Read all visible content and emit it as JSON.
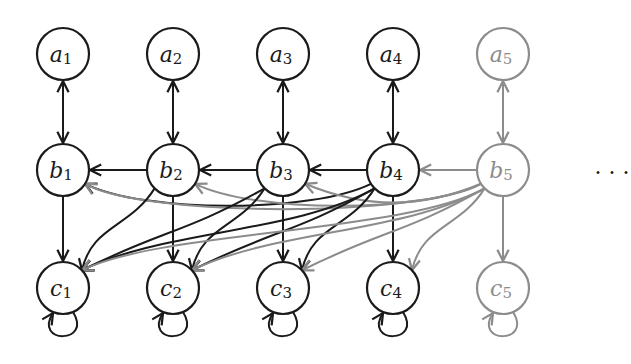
{
  "colors": {
    "active": "#1a1a1a",
    "faded": "#8c8c8c"
  },
  "layout": {
    "x": [
      63,
      173,
      283,
      393,
      503
    ],
    "rows": {
      "a": 54,
      "b": 170,
      "c": 288
    },
    "radius": 26
  },
  "nodes": [
    {
      "id": "a1",
      "letter": "a",
      "sub": "1",
      "row": "a",
      "col": 0,
      "faded": false
    },
    {
      "id": "a2",
      "letter": "a",
      "sub": "2",
      "row": "a",
      "col": 1,
      "faded": false
    },
    {
      "id": "a3",
      "letter": "a",
      "sub": "3",
      "row": "a",
      "col": 2,
      "faded": false
    },
    {
      "id": "a4",
      "letter": "a",
      "sub": "4",
      "row": "a",
      "col": 3,
      "faded": false
    },
    {
      "id": "a5",
      "letter": "a",
      "sub": "5",
      "row": "a",
      "col": 4,
      "faded": true
    },
    {
      "id": "b1",
      "letter": "b",
      "sub": "1",
      "row": "b",
      "col": 0,
      "faded": false
    },
    {
      "id": "b2",
      "letter": "b",
      "sub": "2",
      "row": "b",
      "col": 1,
      "faded": false
    },
    {
      "id": "b3",
      "letter": "b",
      "sub": "3",
      "row": "b",
      "col": 2,
      "faded": false
    },
    {
      "id": "b4",
      "letter": "b",
      "sub": "4",
      "row": "b",
      "col": 3,
      "faded": false
    },
    {
      "id": "b5",
      "letter": "b",
      "sub": "5",
      "row": "b",
      "col": 4,
      "faded": true
    },
    {
      "id": "c1",
      "letter": "c",
      "sub": "1",
      "row": "c",
      "col": 0,
      "faded": false
    },
    {
      "id": "c2",
      "letter": "c",
      "sub": "2",
      "row": "c",
      "col": 1,
      "faded": false
    },
    {
      "id": "c3",
      "letter": "c",
      "sub": "3",
      "row": "c",
      "col": 2,
      "faded": false
    },
    {
      "id": "c4",
      "letter": "c",
      "sub": "4",
      "row": "c",
      "col": 3,
      "faded": false
    },
    {
      "id": "c5",
      "letter": "c",
      "sub": "5",
      "row": "c",
      "col": 4,
      "faded": true
    }
  ],
  "edges": {
    "a_b_bidirectional": [
      [
        "a1",
        "b1"
      ],
      [
        "a2",
        "b2"
      ],
      [
        "a3",
        "b3"
      ],
      [
        "a4",
        "b4"
      ],
      [
        "a5",
        "b5"
      ]
    ],
    "b_chain": [
      [
        "b2",
        "b1"
      ],
      [
        "b3",
        "b2"
      ],
      [
        "b4",
        "b3"
      ],
      [
        "b5",
        "b4"
      ]
    ],
    "b_to_c_vertical": [
      [
        "b1",
        "c1"
      ],
      [
        "b2",
        "c2"
      ],
      [
        "b3",
        "c3"
      ],
      [
        "b4",
        "c4"
      ],
      [
        "b5",
        "c5"
      ]
    ],
    "b_to_earlier_b": [
      [
        "b4",
        "b1"
      ],
      [
        "b5",
        "b1"
      ],
      [
        "b5",
        "b2"
      ],
      [
        "b5",
        "b3"
      ]
    ],
    "b_to_earlier_c": [
      [
        "b2",
        "c1"
      ],
      [
        "b3",
        "c1"
      ],
      [
        "b3",
        "c2"
      ],
      [
        "b4",
        "c1"
      ],
      [
        "b4",
        "c2"
      ],
      [
        "b4",
        "c3"
      ],
      [
        "b5",
        "c1"
      ],
      [
        "b5",
        "c2"
      ],
      [
        "b5",
        "c3"
      ],
      [
        "b5",
        "c4"
      ]
    ],
    "self_loops": [
      "c1",
      "c2",
      "c3",
      "c4",
      "c5"
    ]
  },
  "ellipsis": {
    "text": "· · ·",
    "x": 612,
    "y": 172
  }
}
